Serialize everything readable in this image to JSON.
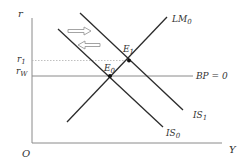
{
  "diagram": {
    "axes": {
      "y_label": "r",
      "x_label": "Y",
      "origin_label": "O"
    },
    "levels": {
      "r1": {
        "base": "r",
        "sub": "1"
      },
      "rw": {
        "base": "r",
        "sub": "W"
      }
    },
    "curves": {
      "lm0": {
        "base": "LM",
        "sub": "0"
      },
      "is0": {
        "base": "IS",
        "sub": "0"
      },
      "is1": {
        "base": "IS",
        "sub": "1"
      },
      "bp": {
        "text": "BP = 0"
      }
    },
    "points": {
      "e0": {
        "base": "E",
        "sub": "0"
      },
      "e1": {
        "base": "E",
        "sub": "1"
      }
    },
    "arrows": [
      {
        "direction": "right"
      },
      {
        "direction": "left"
      }
    ],
    "colors": {
      "curve": "#2b2b2b",
      "axis": "#8a8a8a",
      "text": "#333333"
    }
  }
}
